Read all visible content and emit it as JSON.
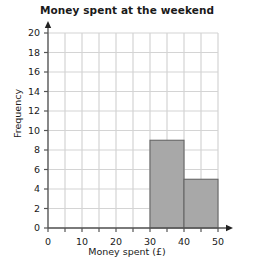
{
  "chart_data": {
    "type": "bar",
    "title": "Money spent at the weekend",
    "xlabel": "Money spent (£)",
    "ylabel": "Frequency",
    "xlim": [
      0,
      50
    ],
    "ylim": [
      0,
      20
    ],
    "grid": true,
    "legend": "none",
    "x_tick_labels": [
      "0",
      "10",
      "20",
      "30",
      "40",
      "50"
    ],
    "x_tick_values": [
      0,
      10,
      20,
      30,
      40,
      50
    ],
    "x_gridline_step": 5,
    "y_tick_labels": [
      "0",
      "2",
      "4",
      "6",
      "8",
      "10",
      "12",
      "14",
      "16",
      "18",
      "20"
    ],
    "y_tick_values": [
      0,
      2,
      4,
      6,
      8,
      10,
      12,
      14,
      16,
      18,
      20
    ],
    "y_gridline_step": 2,
    "categories": [
      "30-40",
      "40-50"
    ],
    "values": [
      9,
      5
    ],
    "bars": [
      {
        "label": "30-40",
        "x_start": 30,
        "x_end": 40,
        "frequency": 9
      },
      {
        "label": "40-50",
        "x_start": 40,
        "x_end": 50,
        "frequency": 5
      }
    ],
    "colors": {
      "bar_fill": "#a8a8a8",
      "bar_edge": "#666666",
      "grid": "#d4d4d4",
      "axis": "#555555",
      "text": "#1a1a1a",
      "background": "#ffffff"
    }
  }
}
